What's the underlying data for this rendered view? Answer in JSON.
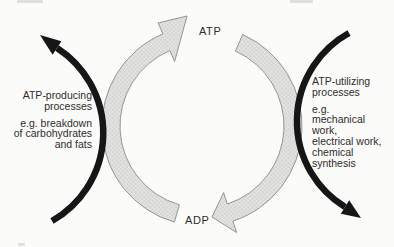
{
  "colors": {
    "bg": "#fbfbfa",
    "band_fill": "#e4e4e2",
    "band_dot": "#9b9b98",
    "band_stroke": "#8a8a88",
    "arrow_black": "#161616",
    "text": "#2e2c2a",
    "artifact": "#c9c9c6"
  },
  "cycle": {
    "top_node": "ATP",
    "bottom_node": "ADP"
  },
  "left_process": {
    "name_lines": [
      "ATP-producing",
      "processes"
    ],
    "example_lines": [
      "e.g. breakdown",
      "of carbohydrates",
      "and fats"
    ]
  },
  "right_process": {
    "name_lines": [
      "ATP-utilizing",
      "processes"
    ],
    "example_lines": [
      "e.g.",
      "mechanical",
      "work,",
      "electrical work,",
      "chemical",
      "synthesis"
    ]
  }
}
